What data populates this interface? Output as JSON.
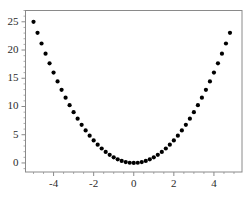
{
  "chart_data": {
    "type": "scatter",
    "title": "",
    "subtitle": "",
    "xlabel": "",
    "ylabel": "",
    "xlim": [
      -5.4,
      5.4
    ],
    "ylim": [
      -1.6,
      27.0
    ],
    "xticks": [
      -4,
      -2,
      0,
      2,
      4
    ],
    "xticklabels": [
      "-4",
      "-2",
      "0",
      "2",
      "4"
    ],
    "yticks": [
      0,
      5,
      10,
      15,
      20,
      25
    ],
    "yticklabels": [
      "0",
      "5",
      "10",
      "15",
      "20",
      "25"
    ],
    "grid": false,
    "legend": null,
    "frame": true,
    "marker": {
      "shape": "circle",
      "color": "#000000",
      "size": 4.2
    },
    "series": [
      {
        "name": "y = x^2",
        "x": [
          -5.0,
          -4.8,
          -4.6,
          -4.4,
          -4.2,
          -4.0,
          -3.8,
          -3.6,
          -3.4,
          -3.2,
          -3.0,
          -2.8,
          -2.6,
          -2.4,
          -2.2,
          -2.0,
          -1.8,
          -1.6,
          -1.4,
          -1.2,
          -1.0,
          -0.8,
          -0.6,
          -0.4,
          -0.2,
          0.0,
          0.2,
          0.4,
          0.6,
          0.8,
          1.0,
          1.2,
          1.4,
          1.6,
          1.8,
          2.0,
          2.2,
          2.4,
          2.6,
          2.8,
          3.0,
          3.2,
          3.4,
          3.6,
          3.8,
          4.0,
          4.2,
          4.4,
          4.6,
          4.8
        ],
        "y": [
          25.0,
          23.04,
          21.16,
          19.36,
          17.64,
          16.0,
          14.44,
          12.96,
          11.56,
          10.24,
          9.0,
          7.84,
          6.76,
          5.76,
          4.84,
          4.0,
          3.24,
          2.56,
          1.96,
          1.44,
          1.0,
          0.64,
          0.36,
          0.16,
          0.04,
          0.0,
          0.04,
          0.16,
          0.36,
          0.64,
          1.0,
          1.44,
          1.96,
          2.56,
          3.24,
          4.0,
          4.84,
          5.76,
          6.76,
          7.84,
          9.0,
          10.24,
          11.56,
          12.96,
          14.44,
          16.0,
          17.64,
          19.36,
          21.16,
          23.04
        ]
      }
    ]
  },
  "colors": {
    "marker": "#000000",
    "axis": "#8a8a8a",
    "tick_text": "#2b2b2b",
    "background": "#ffffff"
  }
}
